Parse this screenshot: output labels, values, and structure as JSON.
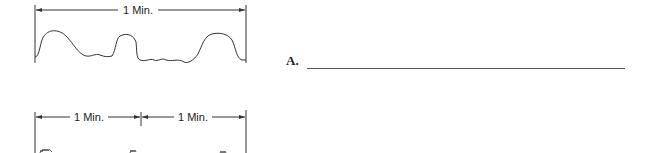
{
  "figure_top": {
    "dimension_label": "1 Min.",
    "description": "waveform spanning one minute with three rounded peaks"
  },
  "figure_bottom": {
    "dimension_labels": [
      "1 Min.",
      "1 Min."
    ],
    "description": "two one-minute intervals with a high-frequency waveform (cropped)"
  },
  "question": {
    "label": "A.",
    "answer_value": ""
  }
}
